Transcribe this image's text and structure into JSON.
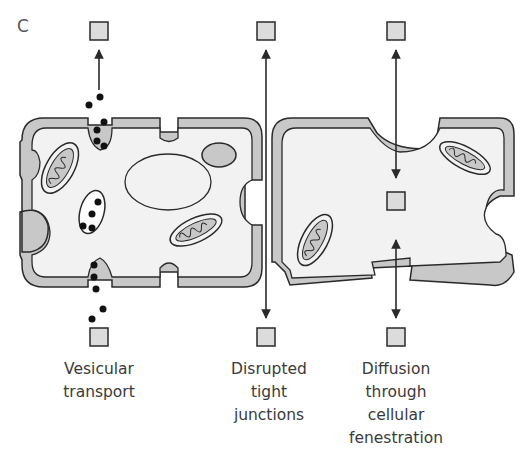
{
  "panel_label": "C",
  "colors": {
    "membrane": "#c8c8c8",
    "cytoplasm": "#f2f2f2",
    "molecule_box": "#dcdcdc",
    "outline": "#2a2a2a",
    "vesicle_dot": "#111111",
    "text": "#3a3a3a"
  },
  "pathways": [
    {
      "id": "vesicular",
      "label_lines": [
        "Vesicular",
        "transport"
      ]
    },
    {
      "id": "tight-junctions",
      "label_lines": [
        "Disrupted",
        "tight",
        "junctions"
      ]
    },
    {
      "id": "fenestration",
      "label_lines": [
        "Diffusion",
        "through",
        "cellular",
        "fenestration"
      ]
    }
  ]
}
